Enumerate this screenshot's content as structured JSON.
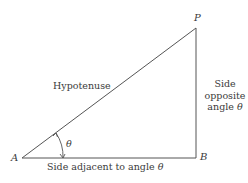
{
  "diagram": {
    "type": "right-triangle",
    "colors": {
      "line": "#555555",
      "text": "#3a3a3a",
      "background": "#ffffff"
    },
    "vertices": {
      "A": {
        "label": "A",
        "x": 22,
        "y": 158
      },
      "B": {
        "label": "B",
        "x": 196,
        "y": 158
      },
      "P": {
        "label": "P",
        "x": 196,
        "y": 28
      }
    },
    "labels": {
      "hypotenuse": "Hypotenuse",
      "adjacent_prefix": "Side adjacent to angle",
      "opposite_line1": "Side",
      "opposite_line2": "opposite",
      "opposite_line3_prefix": "angle",
      "angle_symbol": "θ"
    }
  }
}
